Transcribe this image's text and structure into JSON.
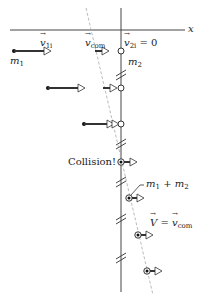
{
  "diagram": {
    "axis_label": "x",
    "labels": {
      "v1i": {
        "symbol": "v",
        "sub": "1i"
      },
      "vcom": {
        "symbol": "v",
        "sub": "com"
      },
      "v2i": {
        "symbol": "v",
        "sub": "2i",
        "suffix": " = 0"
      },
      "m1": {
        "symbol": "m",
        "sub": "1"
      },
      "m2": {
        "symbol": "m",
        "sub": "2"
      },
      "collision": "Collision!",
      "combined": {
        "a": "m",
        "a_sub": "1",
        "plus": " + ",
        "b": "m",
        "b_sub": "2"
      },
      "final": {
        "V": "V",
        "eq": " = ",
        "v": "v",
        "sub": "com"
      }
    },
    "colors": {
      "line": "#333333",
      "dashed": "#999999",
      "arrow_fill": "#ffffff",
      "dot": "#111111"
    }
  }
}
